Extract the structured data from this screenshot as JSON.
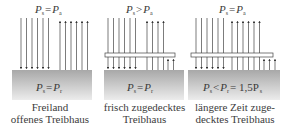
{
  "panels": [
    {
      "id": "freiland",
      "top_formula": {
        "left": "P",
        "left_sub": "s",
        "op": "=",
        "right": "P",
        "right_sub": "a"
      },
      "ground_formula": {
        "left": "P",
        "left_sub": "s",
        "op": "=",
        "right": "P",
        "right_sub": "r",
        "suffix": ""
      },
      "caption_line1": "Freiland",
      "caption_line2": "offenes Treibhaus",
      "has_glass": false,
      "down_arrows": 6,
      "up_arrows_through": 6,
      "up_arrows_trapped": 0
    },
    {
      "id": "frisch",
      "top_formula": {
        "left": "P",
        "left_sub": "s",
        "op": ">",
        "right": "P",
        "right_sub": "a"
      },
      "ground_formula": {
        "left": "P",
        "left_sub": "s",
        "op": "=",
        "right": "P",
        "right_sub": "r",
        "suffix": ""
      },
      "caption_line1": "frisch zugedecktes",
      "caption_line2": "Treibhaus",
      "has_glass": true,
      "down_arrows": 6,
      "up_arrows_through": 4,
      "up_arrows_trapped": 2
    },
    {
      "id": "laenger",
      "top_formula": {
        "left": "P",
        "left_sub": "s",
        "op": "=",
        "right": "P",
        "right_sub": "a"
      },
      "ground_formula": {
        "left": "P",
        "left_sub": "s",
        "op": "<",
        "right": "P",
        "right_sub": "r",
        "suffix": "= 1,5P",
        "suffix_sub": "s"
      },
      "caption_line1": "längere Zeit zuge-",
      "caption_line2": "decktes Treibhaus",
      "has_glass": true,
      "down_arrows": 6,
      "up_arrows_through": 6,
      "up_arrows_trapped": 3
    }
  ],
  "colors": {
    "ground_top": "#a9a9a9",
    "ground_bottom": "#e6e6e6",
    "arrow": "#333333",
    "glass_stroke": "#444444",
    "glass_fill": "#ffffff"
  }
}
